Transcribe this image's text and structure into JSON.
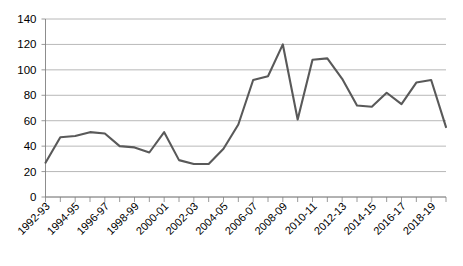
{
  "chart_data": {
    "type": "line",
    "title": "",
    "subtitle": "",
    "xlabel": "",
    "ylabel": "",
    "ylim": [
      0,
      140
    ],
    "ytick_step": 20,
    "ytick_labels": [
      "0",
      "20",
      "40",
      "60",
      "80",
      "100",
      "120",
      "140"
    ],
    "grid": true,
    "grid_axis": "y",
    "legend": false,
    "legend_position": "none",
    "line_color": "#595959",
    "grid_color": "#a6a6a6",
    "axis_color": "#808080",
    "background_color": "#ffffff",
    "x_tick_labels_shown": [
      "1992-93",
      "1994-95",
      "1996-97",
      "1998-99",
      "2000-01",
      "2002-03",
      "2004-05",
      "2006-07",
      "2008-09",
      "2010-11",
      "2012-13",
      "2014-15",
      "2016-17",
      "2018-19"
    ],
    "x": [
      "1992-93",
      "1993-94",
      "1994-95",
      "1995-96",
      "1996-97",
      "1997-98",
      "1998-99",
      "1999-00",
      "2000-01",
      "2001-02",
      "2002-03",
      "2003-04",
      "2004-05",
      "2005-06",
      "2006-07",
      "2007-08",
      "2008-09",
      "2009-10",
      "2010-11",
      "2011-12",
      "2012-13",
      "2013-14",
      "2014-15",
      "2015-16",
      "2016-17",
      "2017-18",
      "2018-19",
      "2019-20"
    ],
    "series": [
      {
        "name": "Series 1",
        "values": [
          27,
          47,
          48,
          51,
          50,
          40,
          39,
          35,
          51,
          29,
          26,
          26,
          38,
          57,
          92,
          95,
          120,
          61,
          108,
          109,
          93,
          72,
          71,
          82,
          73,
          90,
          92,
          55
        ]
      }
    ]
  }
}
